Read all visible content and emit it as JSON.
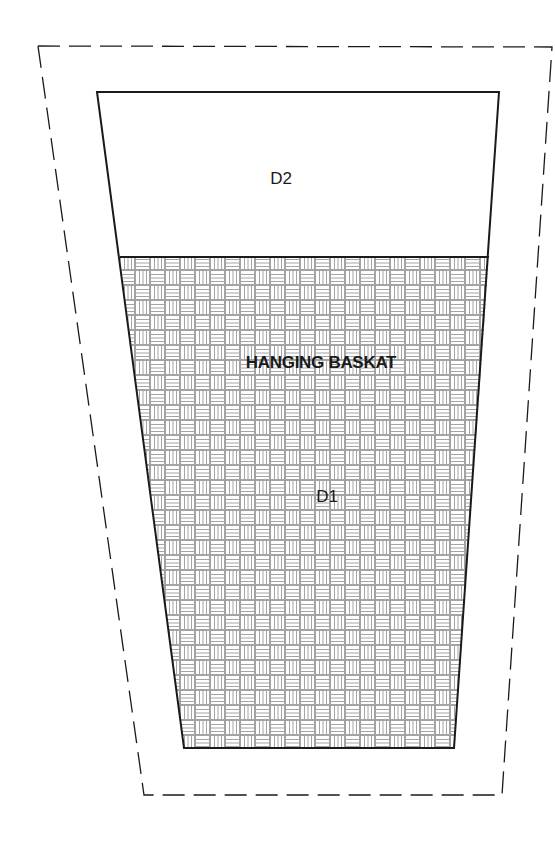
{
  "diagram": {
    "title": "HANGING BASKAT",
    "regions": [
      {
        "id": "D2",
        "label": "D2",
        "fill": "none"
      },
      {
        "id": "D1",
        "label": "D1",
        "fill": "basketweave"
      }
    ],
    "outline": {
      "outer_boundary_style": "dashed",
      "inner_boundary_style": "solid"
    },
    "colors": {
      "stroke": "#1a1a1a",
      "pattern": "#9a9a9a",
      "background": "#ffffff"
    }
  }
}
